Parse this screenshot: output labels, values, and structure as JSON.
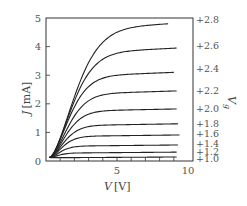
{
  "chart_data": {
    "type": "line",
    "title": "",
    "xlabel": {
      "var": "V",
      "unit": "[V]"
    },
    "ylabel": {
      "var": "J",
      "unit": "[mA]"
    },
    "series_label": {
      "var": "V",
      "sub": "g"
    },
    "xlim": [
      0,
      10
    ],
    "ylim": [
      0,
      5
    ],
    "x_tick_labels": [
      {
        "value": 5,
        "label": "5"
      },
      {
        "value": 10,
        "label": "10"
      }
    ],
    "x_minor_ticks": [
      1,
      2,
      3,
      4,
      5,
      6,
      7,
      8,
      9
    ],
    "y_tick_labels": [
      {
        "value": 0,
        "label": "0"
      },
      {
        "value": 1,
        "label": "1"
      },
      {
        "value": 2,
        "label": "2"
      },
      {
        "value": 3,
        "label": "3"
      },
      {
        "value": 4,
        "label": "4"
      },
      {
        "value": 5,
        "label": "5"
      }
    ],
    "grid": false,
    "legend": "right-side labels",
    "origin": [
      0.25,
      0.12
    ],
    "series": [
      {
        "name": "+2.8",
        "saturation": 4.8,
        "knee": 2.6,
        "slope": 0.03,
        "x_end": 8.6,
        "label_y": 4.95
      },
      {
        "name": "+2.6",
        "saturation": 3.95,
        "knee": 2.3,
        "slope": 0.025,
        "x_end": 9.2,
        "label_y": 4.05
      },
      {
        "name": "+2.4",
        "saturation": 3.1,
        "knee": 2.0,
        "slope": 0.02,
        "x_end": 9.0,
        "label_y": 3.25
      },
      {
        "name": "+2.2",
        "saturation": 2.45,
        "knee": 1.9,
        "slope": 0.015,
        "x_end": 9.2,
        "label_y": 2.45
      },
      {
        "name": "+2.0",
        "saturation": 1.82,
        "knee": 1.7,
        "slope": 0.01,
        "x_end": 9.2,
        "label_y": 1.85
      },
      {
        "name": "+1.8",
        "saturation": 1.3,
        "knee": 1.5,
        "slope": 0.008,
        "x_end": 9.3,
        "label_y": 1.3
      },
      {
        "name": "+1.6",
        "saturation": 0.91,
        "knee": 1.3,
        "slope": 0.006,
        "x_end": 9.4,
        "label_y": 0.95
      },
      {
        "name": "+1.4",
        "saturation": 0.56,
        "knee": 1.1,
        "slope": 0.005,
        "x_end": 9.3,
        "label_y": 0.62
      },
      {
        "name": "+1.2",
        "saturation": 0.31,
        "knee": 0.9,
        "slope": 0.004,
        "x_end": 9.2,
        "label_y": 0.34
      },
      {
        "name": "+1.0",
        "saturation": 0.14,
        "knee": 0.7,
        "slope": 0.003,
        "x_end": 9.2,
        "label_y": 0.1
      }
    ]
  }
}
